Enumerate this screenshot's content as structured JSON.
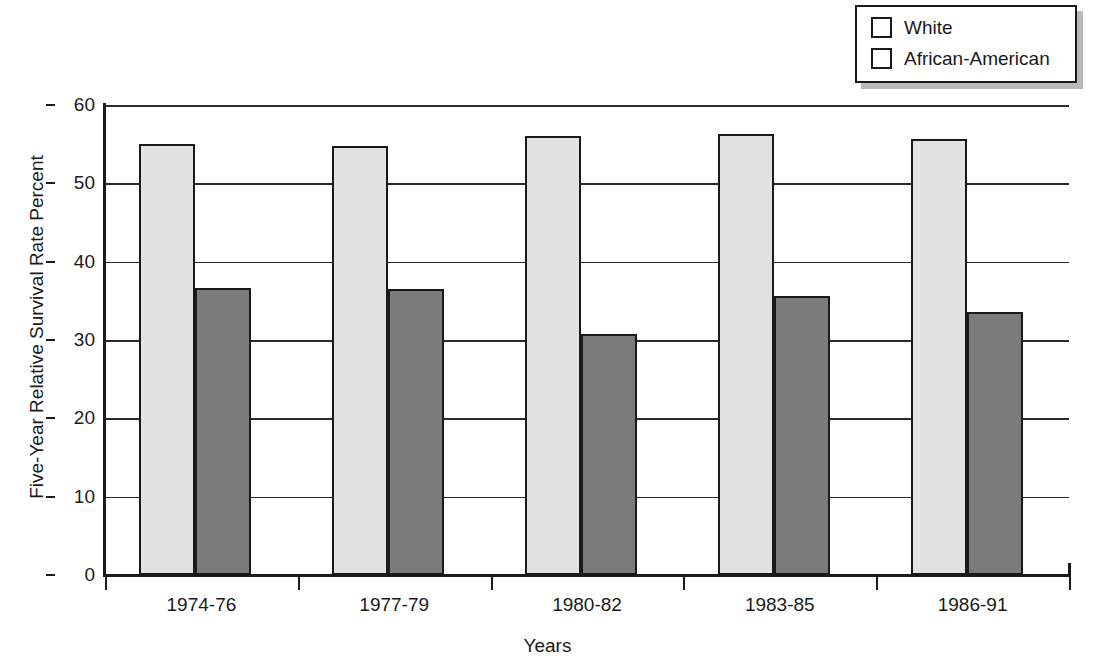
{
  "chart_data": {
    "type": "bar",
    "title": "",
    "xlabel": "Years",
    "ylabel": "Five-Year Relative Survival Rate Percent",
    "categories": [
      "1974-76",
      "1977-79",
      "1980-82",
      "1983-85",
      "1986-91"
    ],
    "series": [
      {
        "name": "White",
        "color": "#e2e2e2",
        "values": [
          55.0,
          54.8,
          56.0,
          56.3,
          55.6
        ]
      },
      {
        "name": "African-American",
        "color": "#7b7b7b",
        "values": [
          36.6,
          36.5,
          30.8,
          35.6,
          33.6
        ]
      }
    ],
    "ylim": [
      0,
      60
    ],
    "yticks": [
      "0",
      "10",
      "20",
      "30",
      "40",
      "50",
      "60"
    ],
    "ytick_values": [
      0,
      10,
      20,
      30,
      40,
      50,
      60
    ],
    "grid": "horizontal",
    "legend_position": "top-right"
  },
  "legend": {
    "entries": [
      {
        "label": "White",
        "swatch_color": "#e2e2e2"
      },
      {
        "label": "African-American",
        "swatch_color": "#7b7b7b"
      }
    ]
  },
  "axes": {
    "y_title": "Five-Year Relative Survival Rate Percent",
    "x_title": "Years"
  }
}
